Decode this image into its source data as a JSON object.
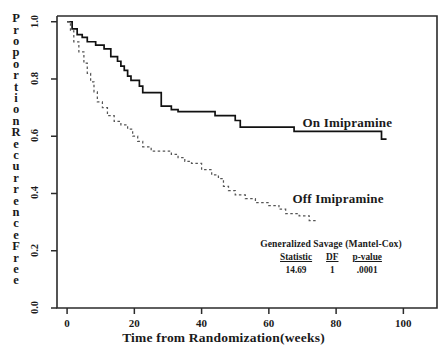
{
  "chart_data": {
    "type": "line",
    "subtype": "kaplan-meier-step",
    "title": "",
    "xlabel": "Time from Randomization(weeks)",
    "ylabel": "Proportion Recurrence Free",
    "xlim": [
      -3,
      110
    ],
    "ylim": [
      0.0,
      1.02
    ],
    "xticks": [
      0,
      20,
      40,
      60,
      80,
      100
    ],
    "xtick_labels": [
      "0",
      "20",
      "40",
      "60",
      "80",
      "100"
    ],
    "yticks": [
      0.0,
      0.2,
      0.4,
      0.6,
      0.8,
      1.0
    ],
    "ytick_labels": [
      "0.0",
      "0.2",
      "0.4",
      "0.6",
      "0.8",
      "1.0"
    ],
    "grid": false,
    "legend_position": "inline-annotations",
    "series": [
      {
        "name": "On Imipramine",
        "style": "solid",
        "color": "#111111",
        "label_x": 70,
        "label_y": 0.645,
        "points": [
          [
            0,
            1.0
          ],
          [
            1.5,
            1.0
          ],
          [
            1.5,
            0.975
          ],
          [
            3,
            0.975
          ],
          [
            3,
            0.955
          ],
          [
            4.5,
            0.955
          ],
          [
            4.5,
            0.945
          ],
          [
            6,
            0.945
          ],
          [
            6,
            0.93
          ],
          [
            8.5,
            0.93
          ],
          [
            8.5,
            0.918
          ],
          [
            11,
            0.918
          ],
          [
            11,
            0.905
          ],
          [
            13,
            0.905
          ],
          [
            13,
            0.878
          ],
          [
            15,
            0.878
          ],
          [
            15,
            0.862
          ],
          [
            16,
            0.862
          ],
          [
            16,
            0.845
          ],
          [
            17,
            0.845
          ],
          [
            17,
            0.83
          ],
          [
            18,
            0.83
          ],
          [
            18,
            0.81
          ],
          [
            19,
            0.81
          ],
          [
            19,
            0.795
          ],
          [
            21.5,
            0.795
          ],
          [
            21.5,
            0.775
          ],
          [
            22.5,
            0.775
          ],
          [
            22.5,
            0.752
          ],
          [
            28,
            0.752
          ],
          [
            28,
            0.705
          ],
          [
            31,
            0.705
          ],
          [
            31,
            0.693
          ],
          [
            33,
            0.693
          ],
          [
            33,
            0.686
          ],
          [
            44,
            0.686
          ],
          [
            44,
            0.672
          ],
          [
            50,
            0.672
          ],
          [
            50,
            0.655
          ],
          [
            51.5,
            0.655
          ],
          [
            51.5,
            0.632
          ],
          [
            67.5,
            0.632
          ],
          [
            67.5,
            0.617
          ],
          [
            93.5,
            0.617
          ],
          [
            93.5,
            0.59
          ],
          [
            95,
            0.59
          ]
        ]
      },
      {
        "name": "Off Imipramine",
        "style": "dashed",
        "color": "#555555",
        "label_x": 67,
        "label_y": 0.382,
        "points": [
          [
            0,
            1.0
          ],
          [
            1,
            1.0
          ],
          [
            1,
            0.968
          ],
          [
            2,
            0.968
          ],
          [
            2,
            0.93
          ],
          [
            3.5,
            0.93
          ],
          [
            3.5,
            0.895
          ],
          [
            5,
            0.895
          ],
          [
            5,
            0.855
          ],
          [
            6,
            0.855
          ],
          [
            6,
            0.82
          ],
          [
            7,
            0.82
          ],
          [
            7,
            0.79
          ],
          [
            8,
            0.79
          ],
          [
            8,
            0.755
          ],
          [
            9,
            0.755
          ],
          [
            9,
            0.72
          ],
          [
            10.5,
            0.72
          ],
          [
            10.5,
            0.7
          ],
          [
            12,
            0.7
          ],
          [
            12,
            0.672
          ],
          [
            14,
            0.672
          ],
          [
            14,
            0.652
          ],
          [
            16,
            0.652
          ],
          [
            16,
            0.64
          ],
          [
            18,
            0.64
          ],
          [
            18,
            0.625
          ],
          [
            19.5,
            0.625
          ],
          [
            19.5,
            0.6
          ],
          [
            21,
            0.6
          ],
          [
            21,
            0.582
          ],
          [
            22.5,
            0.582
          ],
          [
            22.5,
            0.563
          ],
          [
            25,
            0.563
          ],
          [
            25,
            0.548
          ],
          [
            31,
            0.548
          ],
          [
            31,
            0.537
          ],
          [
            33,
            0.537
          ],
          [
            33,
            0.525
          ],
          [
            35,
            0.525
          ],
          [
            35,
            0.512
          ],
          [
            37,
            0.512
          ],
          [
            37,
            0.505
          ],
          [
            40,
            0.505
          ],
          [
            40,
            0.483
          ],
          [
            43,
            0.483
          ],
          [
            43,
            0.465
          ],
          [
            45,
            0.465
          ],
          [
            45,
            0.452
          ],
          [
            46.5,
            0.452
          ],
          [
            46.5,
            0.425
          ],
          [
            48,
            0.425
          ],
          [
            48,
            0.41
          ],
          [
            50,
            0.41
          ],
          [
            50,
            0.395
          ],
          [
            53,
            0.395
          ],
          [
            53,
            0.382
          ],
          [
            56,
            0.382
          ],
          [
            56,
            0.368
          ],
          [
            60,
            0.368
          ],
          [
            60,
            0.358
          ],
          [
            63,
            0.358
          ],
          [
            63,
            0.345
          ],
          [
            65,
            0.345
          ],
          [
            65,
            0.33
          ],
          [
            69,
            0.33
          ],
          [
            69,
            0.322
          ],
          [
            72,
            0.322
          ],
          [
            72,
            0.305
          ],
          [
            74.5,
            0.305
          ]
        ]
      }
    ],
    "annotation": {
      "title": "Generalized Savage (Mantel-Cox)",
      "columns": [
        "Statistic",
        "DF",
        "p-value"
      ],
      "values": [
        "14.69",
        "1",
        ".0001"
      ]
    }
  },
  "axes": {
    "y_title_chars": [
      "P",
      "r",
      "o",
      "p",
      "o",
      "r",
      "t",
      "i",
      "o",
      "n",
      "",
      "R",
      "e",
      "c",
      "u",
      "r",
      "r",
      "e",
      "n",
      "c",
      "e",
      "",
      "F",
      "r",
      "e",
      "e"
    ]
  }
}
